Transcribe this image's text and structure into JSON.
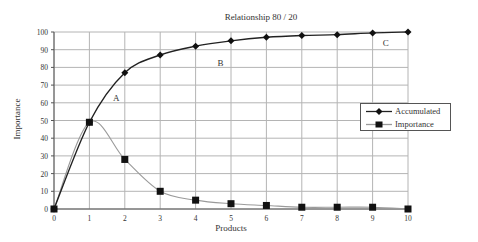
{
  "chart_data": {
    "type": "line",
    "title": "Relationship 80 / 20",
    "xlabel": "Products",
    "ylabel": "Importance",
    "x": [
      0,
      1,
      2,
      3,
      4,
      5,
      6,
      7,
      8,
      9,
      10
    ],
    "xlim": [
      0,
      10
    ],
    "ylim": [
      0,
      100
    ],
    "x_ticks": [
      "0",
      "1",
      "2",
      "3",
      "4",
      "5",
      "6",
      "7",
      "8",
      "9",
      "10"
    ],
    "y_ticks": [
      "0",
      "10",
      "20",
      "30",
      "40",
      "50",
      "60",
      "70",
      "80",
      "90",
      "100"
    ],
    "grid": true,
    "legend_position": "right",
    "series": [
      {
        "name": "Accumulated",
        "marker": "diamond",
        "color": "#222222",
        "values": [
          0,
          49,
          77,
          87,
          92,
          95,
          97,
          98,
          98.5,
          99.5,
          100
        ]
      },
      {
        "name": "Importance",
        "marker": "square",
        "color": "#222222",
        "line_color": "#9a9a9a",
        "values": [
          0,
          49,
          28,
          10,
          5,
          3,
          2,
          1,
          1,
          1,
          0
        ]
      }
    ],
    "annotations": [
      {
        "text": "A",
        "x": 1.75,
        "y": 62
      },
      {
        "text": "B",
        "x": 4.7,
        "y": 82
      },
      {
        "text": "C",
        "x": 9.37,
        "y": 93.5
      }
    ]
  },
  "colors": {
    "grid": "#b4b4b4",
    "axis": "#555555",
    "background": "#ffffff"
  }
}
